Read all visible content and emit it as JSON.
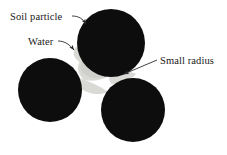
{
  "figure": {
    "name": "soil-particle-water-meniscus-diagram",
    "background_color": "#ffffff",
    "width": 227,
    "height": 155
  },
  "colors": {
    "particle": "#0d0d0d",
    "water": "#d9d9d6",
    "water_shadow": "#c8c8c4",
    "leader_line": "#2b2b2b",
    "text": "#1a1a1a",
    "background": "#ffffff"
  },
  "labels": [
    {
      "id": "soil-particle",
      "text": "Soil particle",
      "x": 10,
      "y": 20,
      "anchor": "start"
    },
    {
      "id": "water",
      "text": "Water",
      "x": 28,
      "y": 45,
      "anchor": "start"
    },
    {
      "id": "small-radius",
      "text": "Small radius",
      "x": 160,
      "y": 64,
      "anchor": "start"
    }
  ],
  "particles": [
    {
      "id": "top-particle",
      "cx": 111,
      "cy": 43,
      "r": 34
    },
    {
      "id": "left-particle",
      "cx": 50,
      "cy": 90,
      "r": 32
    },
    {
      "id": "bottom-right-particle",
      "cx": 133,
      "cy": 110,
      "r": 32
    }
  ],
  "menisci": [
    {
      "id": "meniscus-top-left",
      "between": [
        "top-particle",
        "left-particle"
      ]
    },
    {
      "id": "meniscus-top-right",
      "between": [
        "top-particle",
        "bottom-right-particle"
      ]
    },
    {
      "id": "meniscus-left-bottom",
      "between": [
        "left-particle",
        "bottom-right-particle"
      ]
    }
  ],
  "leaders": [
    {
      "id": "leader-soil-particle",
      "from_label": "soil-particle",
      "path": "M 72,16 C 78,16 82,18 85,23",
      "arrow_x": 85.5,
      "arrow_y": 23.5,
      "arrow_angle": 52
    },
    {
      "id": "leader-water",
      "from_label": "water",
      "path": "M 58,41 C 65,41 70,45 74,50",
      "arrow_x": 74.5,
      "arrow_y": 50.5,
      "arrow_angle": 50
    },
    {
      "id": "leader-small-radius",
      "from_label": "small-radius",
      "path": "M 157,60 L 123,74",
      "arrow_x": 122.5,
      "arrow_y": 74.5,
      "arrow_angle": 203
    }
  ]
}
